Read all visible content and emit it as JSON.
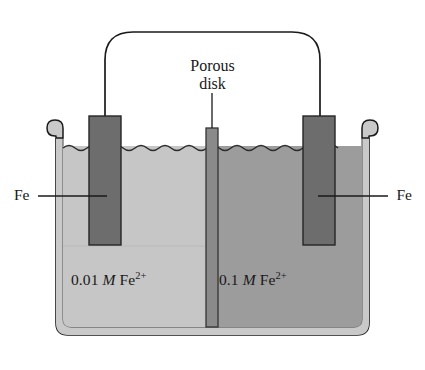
{
  "figure": {
    "type": "electrochemical-cell-diagram"
  },
  "labels": {
    "porous_disk_line1": "Porous",
    "porous_disk_line2": "disk",
    "electrode_left": "Fe",
    "electrode_right": "Fe"
  },
  "solutions": {
    "left": {
      "concentration": "0.01",
      "unit": "M",
      "species": "Fe",
      "charge": "2+"
    },
    "right": {
      "concentration": "0.1",
      "unit": "M",
      "species": "Fe",
      "charge": "2+"
    }
  },
  "colors": {
    "background": "#ffffff",
    "outline": "#1a1a1a",
    "beaker_wall": "#c9c9c9",
    "beaker_wall_edge": "#7d7d7d",
    "solution_left": "#c6c6c6",
    "solution_right": "#9c9c9c",
    "electrode_fill": "#6d6d6d",
    "electrode_edge": "#2a2a2a",
    "porous_disk_fill": "#8a8a8a",
    "porous_disk_edge": "#3a3a3a",
    "wire": "#1a1a1a"
  },
  "parts": {
    "wire": "connecting-wire",
    "beaker": "beaker-vessel",
    "porous_disk": "porous-disk-separator",
    "electrode_left": "iron-electrode-left",
    "electrode_right": "iron-electrode-right",
    "solution_left": "left-half-cell-solution",
    "solution_right": "right-half-cell-solution",
    "surface": "liquid-surface",
    "leader_porous": "porous-disk-leader-line",
    "leader_fe_left": "fe-left-leader-line",
    "leader_fe_right": "fe-right-leader-line"
  }
}
